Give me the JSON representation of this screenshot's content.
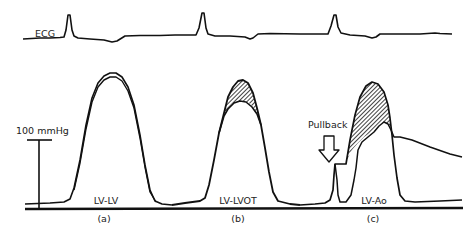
{
  "figure": {
    "type": "pressure-tracing-diagram",
    "ecg_label": "ECG",
    "scale_label": "100 mmHg",
    "pullback_label": "Pullback",
    "panels": [
      {
        "id": "a",
        "tag": "(a)",
        "label": "LV-LV"
      },
      {
        "id": "b",
        "tag": "(b)",
        "label": "LV-LVOT"
      },
      {
        "id": "c",
        "tag": "(c)",
        "label": "LV-Ao"
      }
    ],
    "colors": {
      "trace": "#111111",
      "background": "#ffffff",
      "hatch": "#111111"
    }
  }
}
